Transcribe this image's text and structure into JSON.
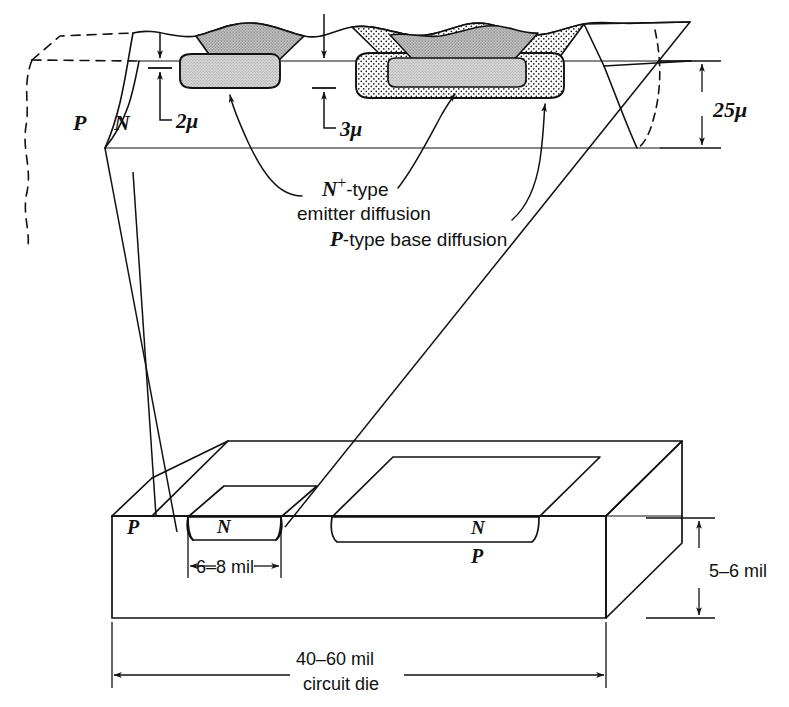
{
  "figure": {
    "colors": {
      "ink": "#111111",
      "emitter_gray": "#c9c9c9",
      "base_stipple": "#ffffff",
      "paper": "#ffffff"
    }
  },
  "detail_view": {
    "region_labels": {
      "substrate_p": "P",
      "epitaxial_n": "N"
    },
    "dimensions": {
      "emitter_depth": "2μ",
      "base_depth": "3μ",
      "wafer_thickness": "25μ"
    },
    "callouts": {
      "emitter_line1": "N",
      "emitter_superscript": "+",
      "emitter_line1_tail": "-type",
      "emitter_line2": "emitter diffusion",
      "base_label_italic": "P",
      "base_label_tail": "-type base diffusion"
    }
  },
  "die_view": {
    "region_labels": {
      "left_p": "P",
      "left_n": "N",
      "right_n": "N",
      "right_p": "P"
    },
    "dimensions": {
      "device_width": "6–8 mil",
      "die_thickness": "5–6 mil",
      "die_width": "40–60 mil",
      "die_width_caption": "circuit die"
    }
  }
}
